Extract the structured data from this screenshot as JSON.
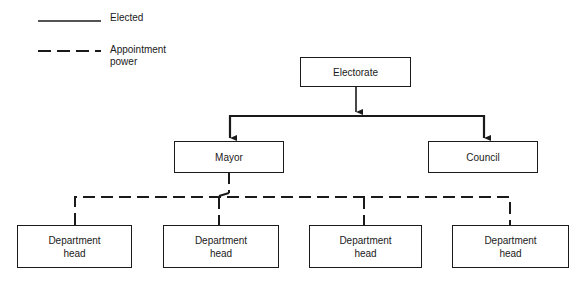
{
  "legend": {
    "elected_label": "Elected",
    "appointment_label_line1": "Appointment",
    "appointment_label_line2": "power"
  },
  "nodes": {
    "electorate": "Electorate",
    "mayor": "Mayor",
    "council": "Council",
    "department_heads": [
      {
        "line1": "Department",
        "line2": "head"
      },
      {
        "line1": "Department",
        "line2": "head"
      },
      {
        "line1": "Department",
        "line2": "head"
      },
      {
        "line1": "Department",
        "line2": "head"
      }
    ]
  },
  "edges": [
    {
      "from": "Electorate",
      "to": "Mayor",
      "type": "elected"
    },
    {
      "from": "Electorate",
      "to": "Council",
      "type": "elected"
    },
    {
      "from": "Mayor",
      "to": "Department head 1",
      "type": "appointment"
    },
    {
      "from": "Mayor",
      "to": "Department head 2",
      "type": "appointment"
    },
    {
      "from": "Mayor",
      "to": "Department head 3",
      "type": "appointment"
    },
    {
      "from": "Mayor",
      "to": "Department head 4",
      "type": "appointment"
    }
  ]
}
